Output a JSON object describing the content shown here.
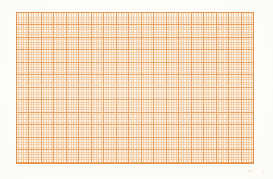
{
  "document": {
    "kind": "graph-paper-scan",
    "title": "Orange millimeter graph paper",
    "canvas_width_px": 273,
    "canvas_height_px": 179,
    "paper_background_color": "#fdfcf8"
  },
  "grid": {
    "label": "graph-paper-grid",
    "left_px": 16,
    "top_px": 12,
    "width_px": 238,
    "height_px": 152,
    "cell_fill_color": "#fdf4e6",
    "minor_line_color": "#f3c99e",
    "major_line_color": "#e69a58",
    "border_line_color": "#e08c42",
    "minor_spacing_px": 2.5,
    "major_spacing_px": 12.5,
    "minor_per_major": 5,
    "minor_columns": 95,
    "minor_rows": 61,
    "major_columns": 19,
    "major_rows": 12
  },
  "artifacts": {
    "vignette": "warm-scanner-vignette",
    "streaks": "horizontal-and-vertical-light-wash",
    "specks": [
      {
        "name": "speck-lower-right",
        "left_px": 248,
        "top_px": 170,
        "width_px": 5,
        "height_px": 2
      },
      {
        "name": "speck-lower-right-small",
        "left_px": 262,
        "top_px": 172,
        "width_px": 3,
        "height_px": 2
      }
    ]
  }
}
